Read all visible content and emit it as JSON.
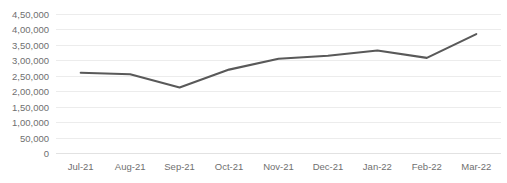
{
  "chart_data": {
    "type": "line",
    "title": "",
    "xlabel": "",
    "ylabel": "",
    "categories": [
      "Jul-21",
      "Aug-21",
      "Sep-21",
      "Oct-21",
      "Nov-21",
      "Dec-21",
      "Jan-22",
      "Feb-22",
      "Mar-22"
    ],
    "values": [
      260000,
      255000,
      212000,
      270000,
      305000,
      315000,
      332000,
      308000,
      385000
    ],
    "series": [
      {
        "name": "",
        "values": [
          260000,
          255000,
          212000,
          270000,
          305000,
          315000,
          332000,
          308000,
          385000
        ]
      }
    ],
    "ylim": [
      0,
      450000
    ],
    "ytick_values": [
      0,
      50000,
      100000,
      150000,
      200000,
      250000,
      300000,
      350000,
      400000,
      450000
    ],
    "ytick_labels": [
      "0",
      "50,000",
      "1,00,000",
      "1,50,000",
      "2,00,000",
      "2,50,000",
      "3,00,000",
      "3,50,000",
      "4,00,000",
      "4,50,000"
    ],
    "grid": true,
    "grid_axis": "y",
    "legend": false,
    "legend_position": "none",
    "markers": false,
    "number_format": "indian-lakh-comma"
  },
  "colors": {
    "line": "#595959",
    "gridline": "#ececec",
    "baseline": "#e2e2e2",
    "tick_text": "#6f6f6f",
    "plot_background": "#ffffff",
    "title_text": "#d8d8dc"
  },
  "style": {
    "line_width": 2.1
  }
}
